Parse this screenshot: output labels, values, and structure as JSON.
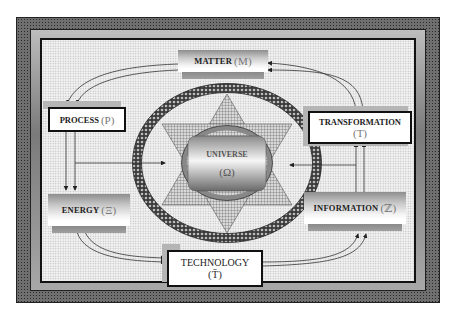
{
  "diagram": {
    "nodes": {
      "matter": {
        "label": "MATTER",
        "symbol": "(M)"
      },
      "process": {
        "label": "PROCESS",
        "symbol": "(P)"
      },
      "transformation": {
        "label": "TRANSFORMATION",
        "symbol": "(T)"
      },
      "universe": {
        "label": "UNIVERSE",
        "symbol": "(Ω)"
      },
      "energy": {
        "label": "ENERGY",
        "symbol": "(Ξ)"
      },
      "information": {
        "label": "INFORMATION",
        "symbol": "(ℤ)"
      },
      "technology": {
        "label": "TECHNOLOGY",
        "symbol": "(T̄)"
      }
    },
    "edges": [
      {
        "from": "matter",
        "to": "process"
      },
      {
        "from": "transformation",
        "to": "matter"
      },
      {
        "from": "process",
        "to": "energy"
      },
      {
        "from": "energy",
        "to": "technology"
      },
      {
        "from": "technology",
        "to": "information"
      },
      {
        "from": "information",
        "to": "transformation"
      },
      {
        "from": "process",
        "to": "universe"
      },
      {
        "from": "transformation",
        "to": "universe"
      }
    ],
    "colors": {
      "frame": "#6f6f6f",
      "background": "#f2f2f2",
      "border": "#111111",
      "symbol": "#777777"
    }
  }
}
